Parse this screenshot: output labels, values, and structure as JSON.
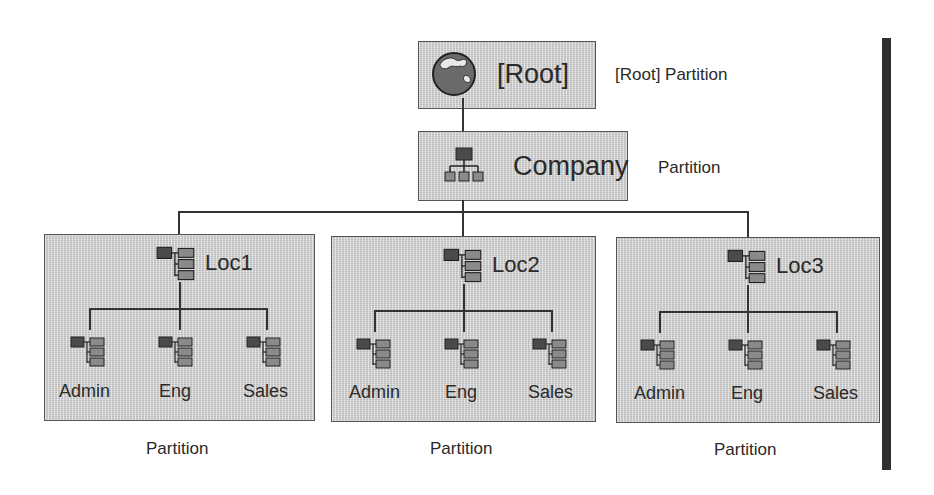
{
  "root": {
    "label": "[Root]",
    "caption": "[Root] Partition",
    "icon": "globe-icon"
  },
  "company": {
    "label": "Company",
    "caption": "Partition",
    "icon": "organization-icon"
  },
  "locations": [
    {
      "label": "Loc1",
      "caption": "Partition",
      "icon": "organizational-unit-icon",
      "children": [
        {
          "label": "Admin"
        },
        {
          "label": "Eng"
        },
        {
          "label": "Sales"
        }
      ]
    },
    {
      "label": "Loc2",
      "caption": "Partition",
      "icon": "organizational-unit-icon",
      "children": [
        {
          "label": "Admin"
        },
        {
          "label": "Eng"
        },
        {
          "label": "Sales"
        }
      ]
    },
    {
      "label": "Loc3",
      "caption": "Partition",
      "icon": "organizational-unit-icon",
      "children": [
        {
          "label": "Admin"
        },
        {
          "label": "Eng"
        },
        {
          "label": "Sales"
        }
      ]
    }
  ],
  "colors": {
    "box_fill": "#cfcfcf",
    "line": "#333333",
    "icon_dark": "#4a4a4a",
    "icon_light": "#8a8a8a",
    "bar": "#2f2f2f"
  }
}
